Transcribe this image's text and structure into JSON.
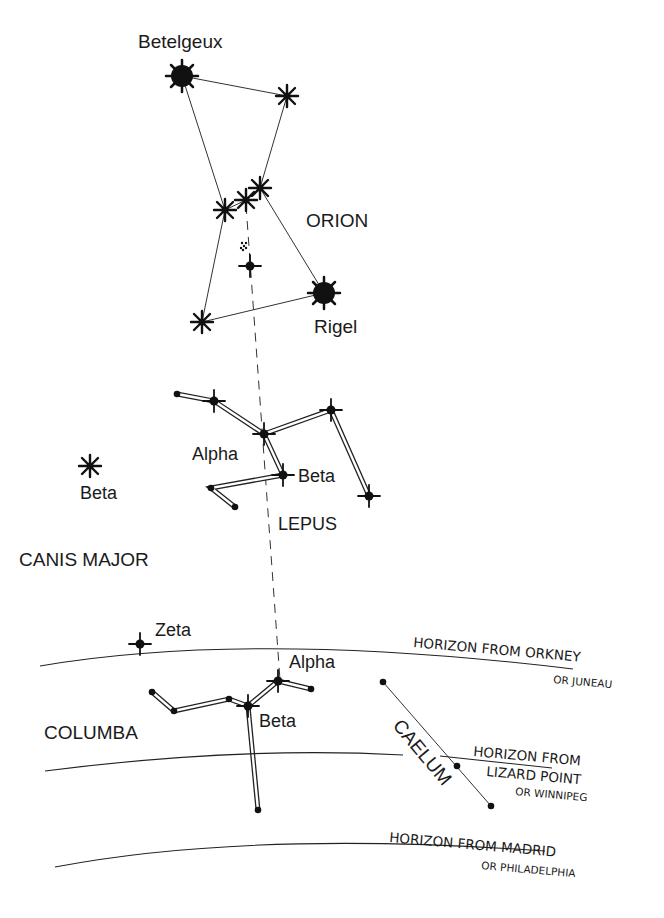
{
  "constellations": {
    "orion": {
      "label": "ORION"
    },
    "lepus": {
      "label": "LEPUS"
    },
    "canis_major": {
      "label": "CANIS MAJOR"
    },
    "columba": {
      "label": "COLUMBA"
    },
    "caelum": {
      "label": "CAELUM"
    }
  },
  "stars": {
    "betelgeux": "Betelgeux",
    "rigel": "Rigel",
    "lepus_alpha": "Alpha",
    "lepus_beta": "Beta",
    "canis_major_beta": "Beta",
    "columba_zeta": "Zeta",
    "columba_alpha": "Alpha",
    "columba_beta": "Beta"
  },
  "horizons": [
    {
      "line1": "HORIZON FROM ORKNEY",
      "line2": "OR JUNEAU"
    },
    {
      "line1": "HORIZON FROM",
      "line2": "LIZARD POINT",
      "line3": "OR WINNIPEG"
    },
    {
      "line1": "HORIZON FROM MADRID",
      "line2": "OR PHILADELPHIA"
    }
  ]
}
